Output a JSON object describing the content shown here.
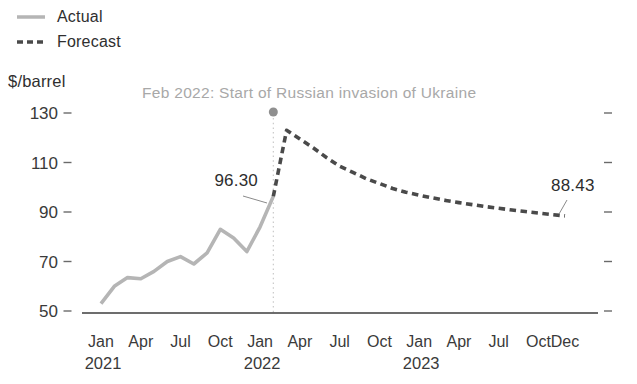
{
  "legend": {
    "items": [
      {
        "label": "Actual",
        "style": "solid",
        "color": "#b5b5b5"
      },
      {
        "label": "Forecast",
        "style": "dashed",
        "color": "#4a4a4a"
      }
    ]
  },
  "chart_data": {
    "type": "line",
    "title": "",
    "ylabel": "$/barrel",
    "xlabel": "",
    "ylim": [
      50,
      130
    ],
    "yticks": [
      50,
      70,
      90,
      110,
      130
    ],
    "grid": false,
    "legend_position": "top-left",
    "x_unit": "months since Jan 2021",
    "x_ticks": [
      {
        "month": 0,
        "label": "Jan"
      },
      {
        "month": 3,
        "label": "Apr"
      },
      {
        "month": 6,
        "label": "Jul"
      },
      {
        "month": 9,
        "label": "Oct"
      },
      {
        "month": 12,
        "label": "Jan"
      },
      {
        "month": 15,
        "label": "Apr"
      },
      {
        "month": 18,
        "label": "Jul"
      },
      {
        "month": 21,
        "label": "Oct"
      },
      {
        "month": 24,
        "label": "Jan"
      },
      {
        "month": 27,
        "label": "Apr"
      },
      {
        "month": 30,
        "label": "Jul"
      },
      {
        "month": 33,
        "label": "Oct"
      },
      {
        "month": 35,
        "label": "Dec"
      }
    ],
    "year_labels": [
      {
        "label": "2021",
        "month": 0
      },
      {
        "label": "2022",
        "month": 12
      },
      {
        "label": "2023",
        "month": 24
      }
    ],
    "series": [
      {
        "name": "Actual",
        "style": "solid",
        "color": "#b5b5b5",
        "start_month": 0,
        "start_label": "Jan 2021",
        "values": [
          53,
          60,
          63.5,
          63,
          66,
          70,
          72,
          69,
          73.5,
          83,
          79.5,
          74,
          84,
          96.3
        ]
      },
      {
        "name": "Forecast",
        "style": "dashed",
        "color": "#4a4a4a",
        "start_month": 13,
        "start_label": "Feb 2022",
        "values": [
          96.3,
          123,
          119.5,
          116,
          112,
          108.5,
          106,
          103.5,
          101.5,
          99.5,
          98,
          96.8,
          95.7,
          94.7,
          93.8,
          93,
          92.2,
          91.5,
          90.8,
          90.2,
          89.6,
          89,
          88.43
        ]
      }
    ],
    "event": {
      "month": 13,
      "label": "Feb 2022: Start of Russian invasion of Ukraine",
      "marker_color": "#8f8f8f",
      "guide_color": "#c9c9c9"
    },
    "end_labels": {
      "actual": "96.30",
      "forecast": "88.43"
    },
    "axis_color": "#3d3d3d",
    "tick_label_color": "#3a3a3a"
  }
}
